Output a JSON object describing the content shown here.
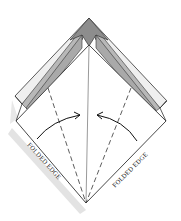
{
  "diagram": {
    "type": "origami-fold-step",
    "labels": {
      "left_edge": "FOLDED EDGE",
      "right_edge": "FOLDED EDGE"
    },
    "colors": {
      "paper_front": "#ffffff",
      "paper_back_light": "#ededed",
      "paper_back_mid": "#b5b5b5",
      "paper_back_dark": "#8c8c8c",
      "line": "#333333",
      "shadow": "#d9d9d9"
    },
    "arrows": [
      {
        "name": "fold-arrow-left",
        "direction": "toward-center"
      },
      {
        "name": "fold-arrow-right",
        "direction": "toward-center"
      }
    ],
    "creases": [
      {
        "name": "center-crease",
        "style": "solid"
      },
      {
        "name": "left-valley-fold",
        "style": "dashed"
      },
      {
        "name": "right-valley-fold",
        "style": "dashed"
      }
    ]
  }
}
